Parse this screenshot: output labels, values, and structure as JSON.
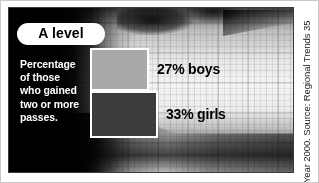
{
  "chart_data": {
    "type": "bar",
    "title": "A level",
    "subtitle": "Percentage of those who gained two or more passes.",
    "categories": [
      "boys",
      "girls"
    ],
    "values": [
      27,
      33
    ],
    "value_labels": [
      "27% boys",
      "33% girls"
    ],
    "unit": "%",
    "xlabel": "",
    "ylabel": "",
    "xlim": [
      0,
      40
    ],
    "grid": false,
    "legend": "none",
    "orientation": "horizontal",
    "series": [
      {
        "name": "boys",
        "value": 27,
        "label": "27% boys",
        "color": "#a9a9a9"
      },
      {
        "name": "girls",
        "value": 33,
        "label": "33% girls",
        "color": "#3c3c3c"
      }
    ],
    "source": "Year 2000. Source: Regional Trends 35"
  },
  "panel": {
    "badge": "A level",
    "caption_lines": [
      "Percentage",
      "of those",
      "who gained",
      "two or more",
      "passes."
    ]
  },
  "bars": {
    "boys": {
      "label": "27% boys",
      "color": "#a9a9a9",
      "border_color": "#ffffff"
    },
    "girls": {
      "label": "33% girls",
      "color": "#3c3c3c",
      "border_color": "#ffffff"
    }
  },
  "footer": {
    "source_note": "Year 2000. Source: Regional Trends 35"
  },
  "colors": {
    "panel_background": "#050505",
    "caption_text": "#ffffff",
    "badge_background": "#ffffff",
    "badge_text": "#000000",
    "label_text": "#000000",
    "bar_boys": "#a9a9a9",
    "bar_girls": "#3c3c3c",
    "page_background": "#ffffff"
  }
}
